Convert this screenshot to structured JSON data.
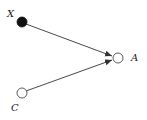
{
  "diagram": {
    "type": "causal-dag",
    "nodes": [
      {
        "id": "X",
        "label": "X",
        "filled": true,
        "cx": 22,
        "cy": 22,
        "r": 5,
        "label_x": 7,
        "label_y": 17
      },
      {
        "id": "A",
        "label": "A",
        "filled": false,
        "cx": 118,
        "cy": 58,
        "r": 5,
        "label_x": 131,
        "label_y": 61
      },
      {
        "id": "C",
        "label": "C",
        "filled": false,
        "cx": 22,
        "cy": 93,
        "r": 5,
        "label_x": 11,
        "label_y": 111
      }
    ],
    "edges": [
      {
        "from": "X",
        "to": "A"
      },
      {
        "from": "C",
        "to": "A"
      }
    ],
    "colors": {
      "stroke": "#333333",
      "fill_filled": "#111111",
      "fill_open": "#ffffff"
    }
  }
}
